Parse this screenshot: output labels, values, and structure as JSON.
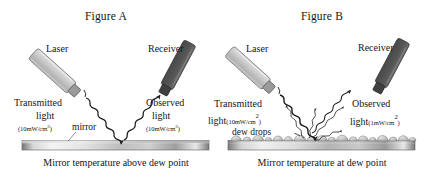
{
  "figure": {
    "panels": [
      {
        "id": "A",
        "title": "Figure A",
        "laser_label": "Laser",
        "receiver_label": "Receiver",
        "transmitted_label_line1": "Transmitted",
        "transmitted_label_line2": "light",
        "transmitted_unit": "(10mW/cm",
        "transmitted_unit_sup": "2",
        "transmitted_unit_close": ")",
        "observed_label_line1": "Observed",
        "observed_label_line2": "light",
        "observed_unit": "(10mW/cm",
        "observed_unit_sup": "2",
        "observed_unit_close": ")",
        "surface_note": "mirror",
        "caption": "Mirror temperature above dew point"
      },
      {
        "id": "B",
        "title": "Figure B",
        "laser_label": "Laser",
        "receiver_label": "Receiver",
        "transmitted_label_line1": "Transmitted",
        "transmitted_label_line2": "light",
        "transmitted_unit": "(10mW/cm",
        "transmitted_unit_sup": "2",
        "transmitted_unit_close": ")",
        "observed_label_line1": "Observed",
        "observed_label_line2": "light",
        "observed_unit": "(1mW/cm",
        "observed_unit_sup": "2",
        "observed_unit_close": ")",
        "surface_note": "dew drops",
        "caption": "Mirror temperature at dew point"
      }
    ],
    "colors": {
      "laser_body": "#c8c8c8",
      "laser_tip": "#8d8d8d",
      "receiver_body": "#5a5a5a",
      "receiver_tip": "#3f3f3f",
      "mirror_light": "#f2f2f2",
      "mirror_dark": "#6f6f6f",
      "dew_drop": "#b9b9b9",
      "ray": "#1a1a1a",
      "background": "#ffffff"
    }
  }
}
